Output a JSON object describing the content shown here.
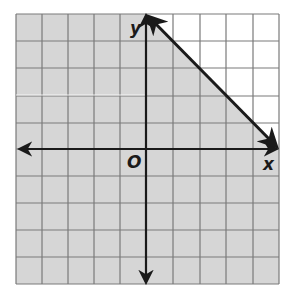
{
  "graph": {
    "type": "linear-inequality",
    "grid": {
      "x_min": -5,
      "x_max": 5,
      "y_min": -5,
      "y_max": 5,
      "step": 1
    },
    "axis_labels": {
      "x": "x",
      "y": "y",
      "origin": "O"
    },
    "boundary_line": {
      "style": "solid",
      "from": [
        0,
        5
      ],
      "to": [
        5,
        0
      ],
      "arrows": "both"
    },
    "shaded_region": "below-left of line",
    "colors": {
      "shade": "#d6d6d6",
      "unshaded": "#ffffff",
      "grid": "#7a7a7a",
      "axis": "#1a1a1a"
    }
  }
}
